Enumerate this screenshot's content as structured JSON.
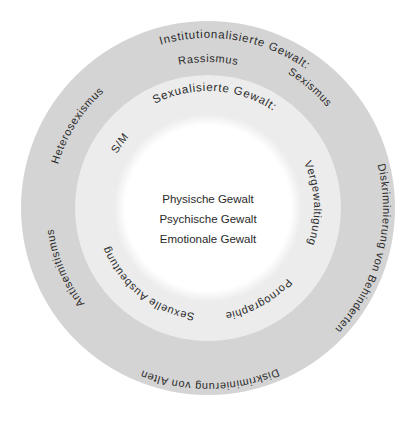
{
  "diagram": {
    "colors": {
      "outer_ring": "#d4d4d4",
      "inner_ring": "#ececec",
      "center": "#ffffff",
      "text": "#2b2b2b"
    },
    "outer_ring": {
      "title": "Institutionalisierte Gewalt:",
      "items": [
        "Rassismus",
        "Sexismus",
        "Diskriminierung von Behinderten",
        "Diskriminierung von Alten",
        "Antisemitismus",
        "Heterosexismus"
      ]
    },
    "inner_ring": {
      "title": "Sexualisierte Gewalt:",
      "items": [
        "Vergewaltigung",
        "Pornographie",
        "Sexuelle Ausbeutung",
        "S/M"
      ]
    },
    "center": {
      "items": [
        "Physische Gewalt",
        "Psychische Gewalt",
        "Emotionale Gewalt"
      ]
    }
  }
}
